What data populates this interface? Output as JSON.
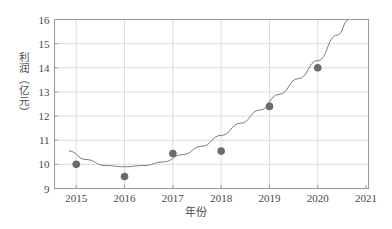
{
  "chart_data": {
    "type": "scatter",
    "title": "",
    "xlabel": "年份",
    "ylabel": "利润（亿元）",
    "x": [
      2015,
      2016,
      2017,
      2018,
      2019,
      2020
    ],
    "values": [
      10.0,
      9.5,
      10.45,
      10.55,
      12.4,
      14.0
    ],
    "series": [
      {
        "name": "利润",
        "type": "scatter",
        "x": [
          2015,
          2016,
          2017,
          2018,
          2019,
          2020
        ],
        "values": [
          10.0,
          9.5,
          10.45,
          10.55,
          12.4,
          14.0
        ]
      },
      {
        "name": "拟合曲线",
        "type": "line",
        "x": [
          2014.85,
          2015.2,
          2015.6,
          2016.0,
          2016.4,
          2016.8,
          2017.2,
          2017.6,
          2018.0,
          2018.4,
          2018.8,
          2019.2,
          2019.6,
          2020.0,
          2020.4,
          2020.65
        ],
        "values": [
          10.55,
          10.2,
          9.95,
          9.9,
          9.95,
          10.1,
          10.4,
          10.75,
          11.2,
          11.7,
          12.25,
          12.9,
          13.55,
          14.3,
          15.35,
          16.0
        ]
      }
    ],
    "xlim": [
      2014.55,
      2021.05
    ],
    "ylim": [
      9,
      16
    ],
    "xticks": [
      2015,
      2016,
      2017,
      2018,
      2019,
      2020,
      2021
    ],
    "xticklabels": [
      "2015",
      "2016",
      "2017",
      "2018",
      "2019",
      "2020",
      "2021"
    ],
    "yticks": [
      9,
      10,
      11,
      12,
      13,
      14,
      15,
      16
    ],
    "yticklabels": [
      "9",
      "10",
      "11",
      "12",
      "13",
      "14",
      "15",
      "16"
    ],
    "grid": true,
    "legend": false,
    "colors": {
      "point": "#6b6b6b",
      "line": "#7a7a7a",
      "grid": "#dcdcdc",
      "frame": "#9a9a9a",
      "text": "#4a4a4a",
      "background": "#ffffff"
    }
  }
}
